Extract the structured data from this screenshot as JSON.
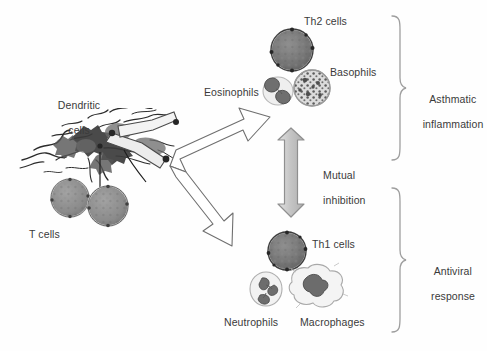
{
  "figure": {
    "background_color": "#fefefe",
    "text_color": "#3a3a3a",
    "arrow_fill": "#c9c9c9",
    "arrow_outline": "#7a7a7a",
    "block_arrow_outline": "#6f6f6f",
    "brace_color": "#9a9a9a"
  },
  "labels": {
    "dendritic_cells_line1": "Dendritic",
    "dendritic_cells_line2": "cells",
    "t_cells": "T cells",
    "eosinophils": "Eosinophils",
    "th2_cells": "Th2 cells",
    "basophils": "Basophils",
    "mutual_inhibition_line1": "Mutual",
    "mutual_inhibition_line2": "inhibition",
    "th1_cells": "Th1 cells",
    "neutrophils": "Neutrophils",
    "macrophages": "Macrophages",
    "asthmatic_inflammation_line1": "Asthmatic",
    "asthmatic_inflammation_line2": "inflammation",
    "antiviral_response_line1": "Antiviral",
    "antiviral_response_line2": "response"
  },
  "cells": {
    "dendritic": {
      "name": "dendritic-cell-network",
      "count": 1
    },
    "t_cell_left": {
      "name": "t-cell",
      "fill": "#8a8a8a"
    },
    "t_cell_right": {
      "name": "t-cell",
      "fill": "#8a8a8a"
    },
    "th2": {
      "name": "th2-cell",
      "fill": "#6e6e6e"
    },
    "eosinophil": {
      "name": "eosinophil-cell",
      "fill": "#7e7e7e"
    },
    "basophil": {
      "name": "basophil-cell",
      "fill": "#8d8d8d"
    },
    "th1": {
      "name": "th1-cell",
      "fill": "#6e6e6e"
    },
    "neutrophil": {
      "name": "neutrophil-cell",
      "fill": "#808080"
    },
    "macrophage": {
      "name": "macrophage-cell",
      "fill": "#7b7b7b"
    }
  },
  "arrows": {
    "upper_branch": "block-arrow pointing up-right toward Th2 group",
    "lower_branch": "block-arrow pointing down-right toward Th1 group",
    "mutual": "vertical double-headed gray arrow"
  },
  "braces": {
    "upper": "right curly brace grouping Th2 cells, eosinophils, basophils",
    "lower": "right curly brace grouping Th1 cells, neutrophils, macrophages"
  }
}
